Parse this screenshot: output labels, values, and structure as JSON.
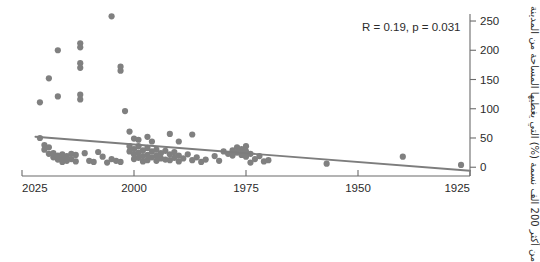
{
  "chart_data": {
    "type": "scatter",
    "title": "",
    "subtitle": "",
    "xlabel": "",
    "ylabel": "من أكثر 200 الف نسمة (%) التي يغطيها المساحة من المدينة",
    "annotation": "R = 0.19, p = 0.031",
    "correlation_R": 0.19,
    "p_value": 0.031,
    "grid": false,
    "legend": null,
    "xlim": [
      2025,
      1925
    ],
    "ylim": [
      -15,
      262
    ],
    "x_axis_reversed": true,
    "xticks": [
      2025,
      2000,
      1975,
      1950,
      1925
    ],
    "xtick_labels": [
      "2025",
      "2000",
      "1975",
      "1950",
      "1925"
    ],
    "yticks": [
      0,
      50,
      100,
      150,
      200,
      250
    ],
    "ytick_labels": [
      "0",
      "50",
      "100",
      "150",
      "200",
      "250"
    ],
    "y_axis_side": "right",
    "point_color": "#808080",
    "line_color": "#7d7d7d",
    "axis_color": "#6b6b6b",
    "trendline": {
      "x_start": 2022,
      "y_start": 52,
      "x_end": 1925,
      "y_end": -6
    },
    "points": [
      {
        "x": 2005,
        "y": 258
      },
      {
        "x": 2012,
        "y": 212
      },
      {
        "x": 2012,
        "y": 205
      },
      {
        "x": 2017,
        "y": 200
      },
      {
        "x": 2012,
        "y": 178
      },
      {
        "x": 2012,
        "y": 170
      },
      {
        "x": 2003,
        "y": 172
      },
      {
        "x": 2003,
        "y": 165
      },
      {
        "x": 2019,
        "y": 152
      },
      {
        "x": 2012,
        "y": 124
      },
      {
        "x": 2012,
        "y": 116
      },
      {
        "x": 2017,
        "y": 121
      },
      {
        "x": 2021,
        "y": 111
      },
      {
        "x": 2002,
        "y": 96
      },
      {
        "x": 2021,
        "y": 50
      },
      {
        "x": 2001,
        "y": 61
      },
      {
        "x": 2000,
        "y": 49
      },
      {
        "x": 1999,
        "y": 47
      },
      {
        "x": 1997,
        "y": 52
      },
      {
        "x": 1996,
        "y": 44
      },
      {
        "x": 1992,
        "y": 57
      },
      {
        "x": 1990,
        "y": 44
      },
      {
        "x": 1987,
        "y": 56
      },
      {
        "x": 2020,
        "y": 38
      },
      {
        "x": 2020,
        "y": 30
      },
      {
        "x": 2019,
        "y": 34
      },
      {
        "x": 2019,
        "y": 23
      },
      {
        "x": 2018,
        "y": 24
      },
      {
        "x": 2018,
        "y": 17
      },
      {
        "x": 2017,
        "y": 20
      },
      {
        "x": 2017,
        "y": 13
      },
      {
        "x": 2016,
        "y": 22
      },
      {
        "x": 2016,
        "y": 14
      },
      {
        "x": 2016,
        "y": 9
      },
      {
        "x": 2015,
        "y": 19
      },
      {
        "x": 2015,
        "y": 11
      },
      {
        "x": 2014,
        "y": 23
      },
      {
        "x": 2014,
        "y": 14
      },
      {
        "x": 2013,
        "y": 21
      },
      {
        "x": 2013,
        "y": 10
      },
      {
        "x": 2011,
        "y": 24
      },
      {
        "x": 2010,
        "y": 11
      },
      {
        "x": 2009,
        "y": 9
      },
      {
        "x": 2008,
        "y": 26
      },
      {
        "x": 2007,
        "y": 18
      },
      {
        "x": 2006,
        "y": 8
      },
      {
        "x": 2005,
        "y": 14
      },
      {
        "x": 2004,
        "y": 11
      },
      {
        "x": 2003,
        "y": 9
      },
      {
        "x": 2001,
        "y": 36
      },
      {
        "x": 2001,
        "y": 27
      },
      {
        "x": 2000,
        "y": 31
      },
      {
        "x": 2000,
        "y": 22
      },
      {
        "x": 2000,
        "y": 14
      },
      {
        "x": 1999,
        "y": 36
      },
      {
        "x": 1999,
        "y": 25
      },
      {
        "x": 1999,
        "y": 16
      },
      {
        "x": 1998,
        "y": 29
      },
      {
        "x": 1998,
        "y": 19
      },
      {
        "x": 1998,
        "y": 10
      },
      {
        "x": 1997,
        "y": 33
      },
      {
        "x": 1997,
        "y": 21
      },
      {
        "x": 1997,
        "y": 12
      },
      {
        "x": 1996,
        "y": 27
      },
      {
        "x": 1996,
        "y": 17
      },
      {
        "x": 1995,
        "y": 30
      },
      {
        "x": 1995,
        "y": 20
      },
      {
        "x": 1995,
        "y": 11
      },
      {
        "x": 1994,
        "y": 24
      },
      {
        "x": 1994,
        "y": 15
      },
      {
        "x": 1993,
        "y": 28
      },
      {
        "x": 1993,
        "y": 13
      },
      {
        "x": 1992,
        "y": 22
      },
      {
        "x": 1992,
        "y": 12
      },
      {
        "x": 1991,
        "y": 26
      },
      {
        "x": 1991,
        "y": 16
      },
      {
        "x": 1990,
        "y": 20
      },
      {
        "x": 1990,
        "y": 10
      },
      {
        "x": 1989,
        "y": 15
      },
      {
        "x": 1988,
        "y": 22
      },
      {
        "x": 1987,
        "y": 12
      },
      {
        "x": 1986,
        "y": 17
      },
      {
        "x": 1985,
        "y": 9
      },
      {
        "x": 1984,
        "y": 13
      },
      {
        "x": 1982,
        "y": 19
      },
      {
        "x": 1981,
        "y": 11
      },
      {
        "x": 1980,
        "y": 27
      },
      {
        "x": 1979,
        "y": 23
      },
      {
        "x": 1978,
        "y": 29
      },
      {
        "x": 1978,
        "y": 20
      },
      {
        "x": 1977,
        "y": 34
      },
      {
        "x": 1977,
        "y": 25
      },
      {
        "x": 1976,
        "y": 31
      },
      {
        "x": 1976,
        "y": 21
      },
      {
        "x": 1975,
        "y": 36
      },
      {
        "x": 1975,
        "y": 27
      },
      {
        "x": 1975,
        "y": 18
      },
      {
        "x": 1974,
        "y": 23
      },
      {
        "x": 1974,
        "y": 8
      },
      {
        "x": 1973,
        "y": 14
      },
      {
        "x": 1972,
        "y": 19
      },
      {
        "x": 1971,
        "y": 10
      },
      {
        "x": 1970,
        "y": 12
      },
      {
        "x": 1957,
        "y": 6
      },
      {
        "x": 1940,
        "y": 18
      },
      {
        "x": 1927,
        "y": 4
      }
    ]
  }
}
